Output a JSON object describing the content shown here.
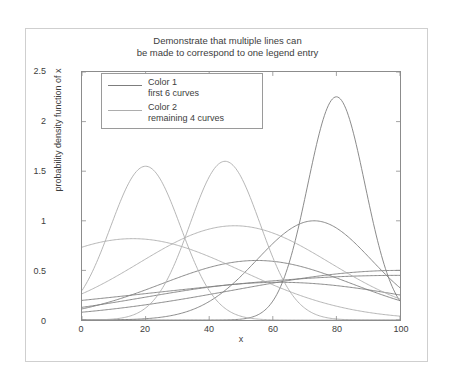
{
  "figure": {
    "title": "Demonstrate that multiple lines can\nbe made to correspond to one legend entry",
    "background": "#ffffff",
    "frame_color": "#cfcfcf",
    "axes_color": "#8c8c8c"
  },
  "axes": {
    "xlabel": "x",
    "ylabel": "probability density function of x",
    "xticks": [
      "0",
      "20",
      "40",
      "60",
      "80",
      "100"
    ],
    "yticks": [
      "0",
      "0.5",
      "1",
      "1.5",
      "2",
      "2.5"
    ]
  },
  "legend": {
    "entries": [
      {
        "label": "Color 1\nfirst 6 curves",
        "color": "#7d7d7d",
        "name": "color-1"
      },
      {
        "label": "Color 2\nremaining 4 curves",
        "color": "#adadad",
        "name": "color-2"
      }
    ]
  },
  "chart_data": {
    "type": "line",
    "title": "Demonstrate that multiple lines can\nbe made to correspond to one legend entry",
    "xlabel": "x",
    "ylabel": "probability density function of x",
    "xlim": [
      0,
      100
    ],
    "ylim": [
      0,
      2.5
    ],
    "xticks": [
      0,
      20,
      40,
      60,
      80,
      100
    ],
    "yticks": [
      0,
      0.5,
      1,
      1.5,
      2,
      2.5
    ],
    "grid": false,
    "legend_position": "upper-left-inside",
    "colors": {
      "color_1": "#7d7d7d",
      "color_2": "#adadad"
    },
    "note": "Gaussian-shaped probability density curves; 6 curves drawn in Color 1 and 4 curves in Color 2, all sharing two legend entries.",
    "series": [
      {
        "name": "curve-1",
        "group": "Color 1",
        "color": "#7d7d7d",
        "peak_x": 80,
        "peak_y": 2.25,
        "width": 9
      },
      {
        "name": "curve-2",
        "group": "Color 1",
        "color": "#7d7d7d",
        "peak_x": 73,
        "peak_y": 1.0,
        "width": 18
      },
      {
        "name": "curve-3",
        "group": "Color 1",
        "color": "#7d7d7d",
        "peak_x": 55,
        "peak_y": 0.6,
        "width": 30
      },
      {
        "name": "curve-4",
        "group": "Color 1",
        "color": "#7d7d7d",
        "peak_x": 100,
        "peak_y": 0.5,
        "width": 52
      },
      {
        "name": "curve-5",
        "group": "Color 1",
        "color": "#7d7d7d",
        "peak_x": 100,
        "peak_y": 0.45,
        "width": 78
      },
      {
        "name": "curve-6",
        "group": "Color 1",
        "color": "#7d7d7d",
        "peak_x": 62,
        "peak_y": 0.38,
        "width": 42
      },
      {
        "name": "curve-7",
        "group": "Color 2",
        "color": "#adadad",
        "peak_x": 20,
        "peak_y": 1.55,
        "width": 11
      },
      {
        "name": "curve-8",
        "group": "Color 2",
        "color": "#adadad",
        "peak_x": 45,
        "peak_y": 1.6,
        "width": 11
      },
      {
        "name": "curve-9",
        "group": "Color 2",
        "color": "#adadad",
        "peak_x": 16,
        "peak_y": 0.82,
        "width": 34
      },
      {
        "name": "curve-10",
        "group": "Color 2",
        "color": "#adadad",
        "peak_x": 48,
        "peak_y": 0.95,
        "width": 30
      }
    ],
    "x": [
      0,
      5,
      10,
      15,
      20,
      25,
      30,
      35,
      40,
      45,
      50,
      55,
      60,
      65,
      70,
      75,
      80,
      85,
      90,
      95,
      100
    ],
    "series_values": [
      {
        "name": "curve-1",
        "values": [
          0.0,
          0.0,
          0.0,
          0.0,
          0.0,
          0.0,
          0.0,
          0.0,
          0.01,
          0.03,
          0.08,
          0.22,
          0.52,
          1.0,
          1.62,
          2.12,
          2.25,
          1.95,
          1.35,
          0.72,
          0.28
        ]
      },
      {
        "name": "curve-2",
        "values": [
          0.0,
          0.0,
          0.01,
          0.02,
          0.04,
          0.08,
          0.14,
          0.23,
          0.36,
          0.52,
          0.68,
          0.82,
          0.93,
          0.99,
          1.0,
          0.97,
          0.88,
          0.74,
          0.58,
          0.42,
          0.28
        ]
      },
      {
        "name": "curve-3",
        "values": [
          0.13,
          0.18,
          0.24,
          0.31,
          0.38,
          0.45,
          0.51,
          0.56,
          0.59,
          0.6,
          0.6,
          0.6,
          0.58,
          0.55,
          0.5,
          0.45,
          0.39,
          0.33,
          0.27,
          0.22,
          0.17
        ]
      },
      {
        "name": "curve-4",
        "values": [
          0.05,
          0.07,
          0.09,
          0.11,
          0.14,
          0.17,
          0.2,
          0.23,
          0.26,
          0.29,
          0.32,
          0.35,
          0.38,
          0.41,
          0.43,
          0.45,
          0.47,
          0.48,
          0.49,
          0.5,
          0.5
        ]
      },
      {
        "name": "curve-5",
        "values": [
          0.15,
          0.17,
          0.19,
          0.21,
          0.23,
          0.25,
          0.27,
          0.29,
          0.31,
          0.33,
          0.35,
          0.36,
          0.38,
          0.39,
          0.41,
          0.42,
          0.43,
          0.44,
          0.44,
          0.45,
          0.45
        ]
      },
      {
        "name": "curve-6",
        "values": [
          0.1,
          0.14,
          0.18,
          0.22,
          0.26,
          0.29,
          0.32,
          0.35,
          0.37,
          0.38,
          0.38,
          0.38,
          0.38,
          0.36,
          0.34,
          0.32,
          0.29,
          0.26,
          0.23,
          0.2,
          0.17
        ]
      },
      {
        "name": "curve-7",
        "values": [
          0.53,
          0.92,
          1.31,
          1.52,
          1.55,
          1.4,
          1.1,
          0.76,
          0.45,
          0.23,
          0.1,
          0.04,
          0.01,
          0.0,
          0.0,
          0.0,
          0.0,
          0.0,
          0.0,
          0.0,
          0.0
        ]
      },
      {
        "name": "curve-8",
        "values": [
          0.0,
          0.0,
          0.0,
          0.01,
          0.03,
          0.1,
          0.28,
          0.63,
          1.1,
          1.55,
          1.6,
          1.3,
          0.88,
          0.48,
          0.22,
          0.08,
          0.02,
          0.01,
          0.0,
          0.0,
          0.0
        ]
      },
      {
        "name": "curve-9",
        "values": [
          0.74,
          0.79,
          0.82,
          0.82,
          0.8,
          0.76,
          0.7,
          0.63,
          0.55,
          0.47,
          0.39,
          0.32,
          0.25,
          0.19,
          0.14,
          0.1,
          0.07,
          0.05,
          0.03,
          0.02,
          0.01
        ]
      },
      {
        "name": "curve-10",
        "values": [
          0.28,
          0.33,
          0.4,
          0.5,
          0.6,
          0.7,
          0.79,
          0.87,
          0.93,
          0.95,
          0.94,
          0.89,
          0.81,
          0.71,
          0.59,
          0.47,
          0.36,
          0.26,
          0.18,
          0.12,
          0.07
        ]
      }
    ]
  }
}
